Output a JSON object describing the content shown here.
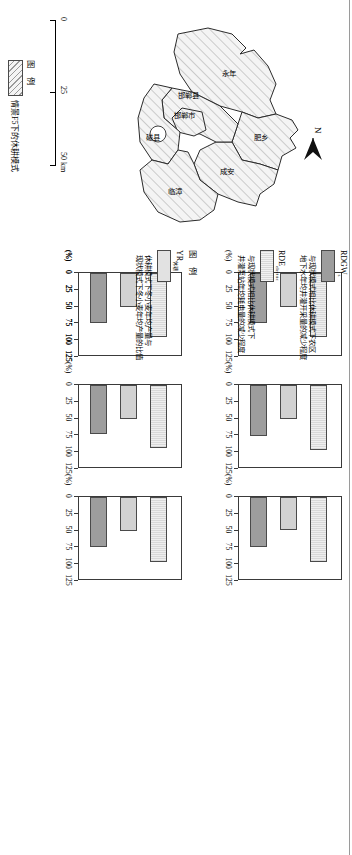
{
  "figure": {
    "orientation": "rotated-90ccw",
    "axis_unit": "(%)"
  },
  "map": {
    "north_label": "N",
    "scale": {
      "ticks": [
        "0",
        "25",
        "50 km"
      ],
      "values": [
        0,
        25,
        50
      ]
    },
    "legend": {
      "title": "图  例",
      "items": [
        {
          "label": "情景F5下的休耕模式",
          "pattern": "diagonal-hatch"
        }
      ]
    },
    "counties": [
      {
        "name": "永年",
        "x": 62,
        "y": 76
      },
      {
        "name": "肥乡",
        "x": 126,
        "y": 50
      },
      {
        "name": "成安",
        "x": 150,
        "y": 96
      },
      {
        "name": "邯郸县",
        "x": 88,
        "y": 120
      },
      {
        "name": "邯郸市",
        "x": 112,
        "y": 126
      },
      {
        "name": "磁县",
        "x": 140,
        "y": 150
      },
      {
        "name": "临漳",
        "x": 190,
        "y": 136
      }
    ]
  },
  "legend_yr": {
    "title": "图  例",
    "symbol": "YR",
    "symbol_sub": "休耕",
    "description_line1": "休耕模式下冬小麦年均产量与",
    "description_line2": "现状模式下冬小麦年均产量的比值"
  },
  "legend_rd": {
    "items": [
      {
        "symbol": "RDGW",
        "symbol_sub": "s",
        "line1": "与现状模式相比休耕模式下农区",
        "line2": "地下水年均井灌开采量的减少程度",
        "color": "#9d9d9d"
      },
      {
        "symbol": "RDE",
        "symbol_sub": "electric",
        "line1": "与现状模式相比休耕模式下",
        "line2": "井灌泵站年均耗电量的减少程度",
        "color": "#e2e2e2"
      }
    ]
  },
  "chart_data": {
    "type": "bar",
    "orientation": "horizontal",
    "title": "",
    "xlabel": "(%)",
    "ylabel": "",
    "xlim": [
      0,
      125
    ],
    "xticks": [
      0,
      25,
      50,
      75,
      100,
      125
    ],
    "grid": false,
    "legend_position": "right",
    "series": [
      {
        "name": "YR休耕",
        "color": "#e2e2e2"
      },
      {
        "name": "RDEelectric",
        "color": "#d2d2d2"
      },
      {
        "name": "RDGWs",
        "color": "#9d9d9d"
      }
    ],
    "panels": [
      {
        "title": "永年县",
        "categories": [
          "YR休耕",
          "RDEelectric",
          "RDGWs"
        ],
        "values": [
          95,
          50,
          74
        ]
      },
      {
        "title": "邯郸县",
        "categories": [
          "YR休耕",
          "RDEelectric",
          "RDGWs"
        ],
        "values": [
          96,
          50,
          76
        ]
      },
      {
        "title": "肥乡县",
        "categories": [
          "YR休耕",
          "RDEelectric",
          "RDGWs"
        ],
        "values": [
          97,
          49,
          75
        ]
      },
      {
        "title": "邯郸市",
        "categories": [
          "YR休耕",
          "RDEelectric",
          "RDGWs"
        ],
        "values": [
          97,
          50,
          75
        ]
      },
      {
        "title": "磁县",
        "categories": [
          "YR休耕",
          "RDEelectric",
          "RDGWs"
        ],
        "values": [
          94,
          50,
          73
        ]
      },
      {
        "title": "成安县",
        "categories": [
          "YR休耕",
          "RDEelectric",
          "RDGWs"
        ],
        "values": [
          96,
          50,
          74
        ]
      },
      {
        "title": "临漳县",
        "categories": [
          "YR休耕",
          "RDEelectric",
          "RDGWs"
        ],
        "values": [
          95,
          50,
          74
        ]
      }
    ]
  }
}
